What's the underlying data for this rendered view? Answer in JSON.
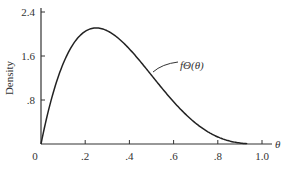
{
  "chart_data": {
    "type": "line",
    "title": "",
    "xlabel": "θ",
    "ylabel": "Density",
    "xlim": [
      0,
      1.0
    ],
    "ylim": [
      0,
      2.4
    ],
    "grid": false,
    "legend": "none",
    "x_ticks": [
      "0",
      ".2",
      ".4",
      ".6",
      ".8",
      "1.0"
    ],
    "y_ticks": [
      ".8",
      "1.6",
      "2.4"
    ],
    "annotation": "fΘ(θ)",
    "series": [
      {
        "name": "fΘ(θ)",
        "x": [
          0,
          0.05,
          0.1,
          0.15,
          0.2,
          0.25,
          0.3,
          0.35,
          0.4,
          0.45,
          0.5,
          0.55,
          0.6,
          0.65,
          0.7,
          0.75,
          0.8,
          0.85,
          0.9,
          0.95,
          1.0
        ],
        "values": [
          0,
          0.86,
          1.46,
          1.84,
          2.05,
          2.11,
          2.06,
          1.92,
          1.73,
          1.5,
          1.25,
          1.0,
          0.77,
          0.56,
          0.38,
          0.23,
          0.13,
          0.06,
          0.02,
          0.0,
          0
        ]
      }
    ]
  }
}
